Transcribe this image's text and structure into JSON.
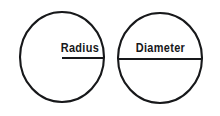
{
  "diagram": {
    "background_color": "#ffffff",
    "stroke_color": "#17181a",
    "figures": [
      {
        "id": "radius-figure",
        "label": "Radius",
        "shape": "circle",
        "center_x": 62,
        "center_y": 57,
        "radius_x": 42,
        "radius_y": 45,
        "segment": {
          "type": "radius",
          "x1": 62,
          "y1": 58,
          "x2": 104,
          "y2": 58
        }
      },
      {
        "id": "diameter-figure",
        "label": "Diameter",
        "shape": "circle",
        "center_x": 160,
        "center_y": 58,
        "radius_x": 42,
        "radius_y": 45,
        "segment": {
          "type": "diameter",
          "x1": 118,
          "y1": 59,
          "x2": 202,
          "y2": 59
        }
      }
    ]
  }
}
